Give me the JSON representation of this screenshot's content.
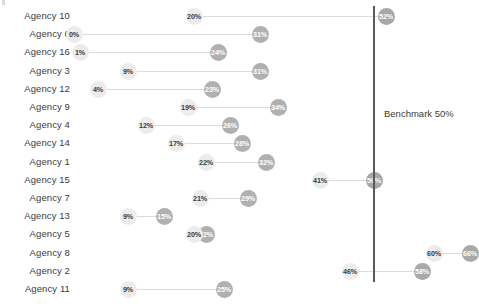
{
  "chart_data": {
    "type": "bar",
    "subtype": "dumbbell-connected-dot-plot",
    "title": "",
    "xlabel": "",
    "ylabel": "",
    "xlim": [
      0,
      68
    ],
    "grid": false,
    "legend": "none",
    "value_suffix": "%",
    "categories": [
      "Agency 10",
      "Agency 6",
      "Agency 16",
      "Agency 3",
      "Agency 12",
      "Agency 9",
      "Agency 4",
      "Agency 14",
      "Agency 1",
      "Agency 15",
      "Agency 7",
      "Agency 13",
      "Agency 5",
      "Agency 8",
      "Agency 2",
      "Agency 11"
    ],
    "series": [
      {
        "name": "Low",
        "values": [
          20,
          0,
          1,
          9,
          4,
          19,
          12,
          17,
          22,
          41,
          21,
          9,
          20,
          60,
          46,
          9
        ]
      },
      {
        "name": "High",
        "values": [
          52,
          31,
          24,
          31,
          23,
          34,
          26,
          28,
          32,
          50,
          29,
          15,
          22,
          66,
          58,
          25
        ]
      }
    ],
    "points": [
      {
        "category": "Agency 10",
        "low": 20,
        "high": 52,
        "low_label": "20%",
        "high_label": "52%"
      },
      {
        "category": "Agency 6",
        "low": 0,
        "high": 31,
        "low_label": "0%",
        "high_label": "31%"
      },
      {
        "category": "Agency 16",
        "low": 1,
        "high": 24,
        "low_label": "1%",
        "high_label": "24%"
      },
      {
        "category": "Agency 3",
        "low": 9,
        "high": 31,
        "low_label": "9%",
        "high_label": "31%"
      },
      {
        "category": "Agency 12",
        "low": 4,
        "high": 23,
        "low_label": "4%",
        "high_label": "23%"
      },
      {
        "category": "Agency 9",
        "low": 19,
        "high": 34,
        "low_label": "19%",
        "high_label": "34%"
      },
      {
        "category": "Agency 4",
        "low": 12,
        "high": 26,
        "low_label": "12%",
        "high_label": "26%"
      },
      {
        "category": "Agency 14",
        "low": 17,
        "high": 28,
        "low_label": "17%",
        "high_label": "28%"
      },
      {
        "category": "Agency 1",
        "low": 22,
        "high": 32,
        "low_label": "22%",
        "high_label": "32%"
      },
      {
        "category": "Agency 15",
        "low": 41,
        "high": 50,
        "low_label": "41%",
        "high_label": "50%"
      },
      {
        "category": "Agency 7",
        "low": 21,
        "high": 29,
        "low_label": "21%",
        "high_label": "29%"
      },
      {
        "category": "Agency 13",
        "low": 9,
        "high": 15,
        "low_label": "9%",
        "high_label": "15%"
      },
      {
        "category": "Agency 5",
        "low": 20,
        "high": 22,
        "low_label": "20%",
        "high_label": "22%"
      },
      {
        "category": "Agency 8",
        "low": 60,
        "high": 66,
        "low_label": "60%",
        "high_label": "66%"
      },
      {
        "category": "Agency 2",
        "low": 46,
        "high": 58,
        "low_label": "46%",
        "high_label": "58%"
      },
      {
        "category": "Agency 11",
        "low": 9,
        "high": 25,
        "low_label": "9%",
        "high_label": "25%"
      }
    ],
    "benchmark": {
      "value": 50,
      "label": "Benchmark 50%"
    },
    "colors": {
      "low_dot": "#ececec",
      "low_text": "#3b3b3b",
      "high_dot": "#b0b0b0",
      "high_text": "#ffffff",
      "connector": "#dcdcdc",
      "benchmark_line": "#595959",
      "category_text": "#3b3b3b",
      "background": "#ffffff"
    }
  }
}
